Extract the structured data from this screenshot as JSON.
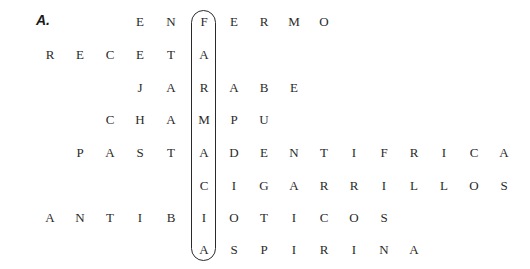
{
  "exercise_label": "A.",
  "key_word": "FARMACIA",
  "key_column": 5,
  "column_x": [
    40,
    70,
    100,
    130,
    161,
    194,
    224,
    254,
    284,
    314,
    344,
    374,
    404,
    434,
    464,
    494
  ],
  "row_y": [
    14,
    47,
    80,
    112,
    145,
    178,
    210,
    242
  ],
  "rows": [
    {
      "word": "ENFERMO",
      "start_col": 3,
      "letters": [
        "E",
        "N",
        "F",
        "E",
        "R",
        "M",
        "O"
      ]
    },
    {
      "word": "RECETA",
      "start_col": 0,
      "letters": [
        "R",
        "E",
        "C",
        "E",
        "T",
        "A"
      ]
    },
    {
      "word": "JARABE",
      "start_col": 3,
      "letters": [
        "J",
        "A",
        "R",
        "A",
        "B",
        "E"
      ]
    },
    {
      "word": "CHAMPU",
      "start_col": 2,
      "letters": [
        "C",
        "H",
        "A",
        "M",
        "P",
        "U"
      ]
    },
    {
      "word": "PASTADENTIFRICA",
      "start_col": 1,
      "letters": [
        "P",
        "A",
        "S",
        "T",
        "A",
        "D",
        "E",
        "N",
        "T",
        "I",
        "F",
        "R",
        "I",
        "C",
        "A"
      ]
    },
    {
      "word": "CIGARRILLOS",
      "start_col": 5,
      "letters": [
        "C",
        "I",
        "G",
        "A",
        "R",
        "R",
        "I",
        "L",
        "L",
        "O",
        "S"
      ]
    },
    {
      "word": "ANTIBIOTICOS",
      "start_col": 0,
      "letters": [
        "A",
        "N",
        "T",
        "I",
        "B",
        "I",
        "O",
        "T",
        "I",
        "C",
        "O",
        "S"
      ]
    },
    {
      "word": "ASPIRINA",
      "start_col": 5,
      "letters": [
        "A",
        "S",
        "P",
        "I",
        "R",
        "I",
        "N",
        "A"
      ]
    }
  ]
}
